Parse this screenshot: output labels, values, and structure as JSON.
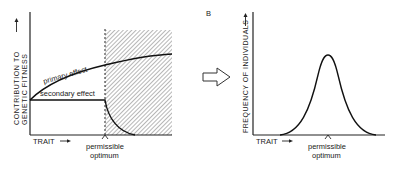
{
  "panel_a": {
    "y_label_line1": "CONTRIBUTION TO",
    "y_label_line2": "GENETIC FITNESS",
    "x_label": "TRAIT",
    "curve_primary_label": "primary effect",
    "curve_secondary_label": "secondary effect",
    "marker_line1": "permissible",
    "marker_line2": "optimum"
  },
  "transition_arrow": "hollow-right-arrow-icon",
  "panel_b": {
    "panel_letter": "B",
    "y_label": "FREQUENCY OF INDIVIDUALS",
    "x_label": "TRAIT",
    "marker_line1": "permissible",
    "marker_line2": "optimum"
  },
  "colors": {
    "ink": "#222222",
    "hatch": "#555555",
    "background": "#ffffff"
  }
}
